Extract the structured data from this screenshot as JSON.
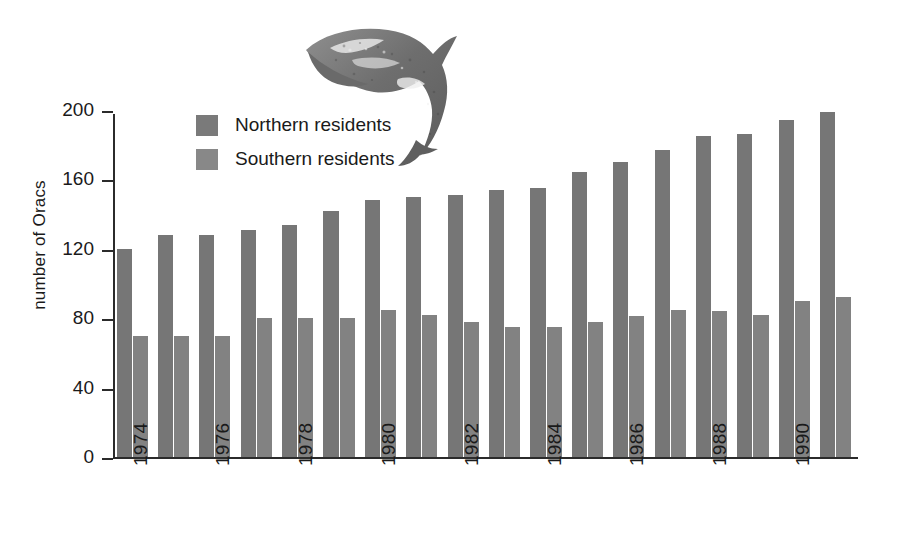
{
  "chart_data": {
    "type": "bar",
    "title": "",
    "subtitle": "",
    "xlabel": "",
    "ylabel": "number of Oracs",
    "ylim": [
      0,
      200
    ],
    "yticks": [
      0,
      40,
      80,
      120,
      160,
      200
    ],
    "grid": false,
    "legend_position": "upper-left-inside",
    "categories": [
      "1974",
      "1975",
      "1976",
      "1977",
      "1978",
      "1979",
      "1980",
      "1981",
      "1982",
      "1983",
      "1984",
      "1985",
      "1986",
      "1987",
      "1988",
      "1989",
      "1990",
      "1991"
    ],
    "visible_tick_labels": [
      "1974",
      "1976",
      "1978",
      "1980",
      "1982",
      "1984",
      "1986",
      "1988",
      "1990"
    ],
    "series": [
      {
        "name": "Northern residents",
        "color": "#767676",
        "values": [
          120,
          128,
          128,
          131,
          134,
          142,
          148,
          150,
          151,
          154,
          155,
          164,
          170,
          177,
          185,
          186,
          194,
          199
        ]
      },
      {
        "name": "Southern residents",
        "color": "#828282",
        "values": [
          70,
          70,
          70,
          80,
          80,
          80,
          85,
          82,
          78,
          75,
          75,
          78,
          81,
          85,
          84,
          82,
          90,
          92
        ]
      }
    ],
    "annotations": [
      {
        "name": "orca-illustration",
        "description": "Leaping killer whale (orca) halftone illustration above the plot"
      }
    ]
  },
  "legend": {
    "items": [
      {
        "label": "Northern residents",
        "swatch": "northern"
      },
      {
        "label": "Southern residents",
        "swatch": "southern"
      }
    ]
  },
  "axes": {
    "y_label": "number of Oracs",
    "y_tick_labels": [
      "200",
      "160",
      "120",
      "80",
      "40",
      "0"
    ],
    "x_tick_labels": [
      "1974",
      "1976",
      "1978",
      "1980",
      "1982",
      "1984",
      "1986",
      "1988",
      "1990"
    ]
  },
  "colors": {
    "northern": "#767676",
    "southern": "#828282",
    "axis": "#2b2b2b",
    "background": "#ffffff"
  },
  "illustration": {
    "name": "orca-illustration",
    "alt": "leaping orca"
  }
}
